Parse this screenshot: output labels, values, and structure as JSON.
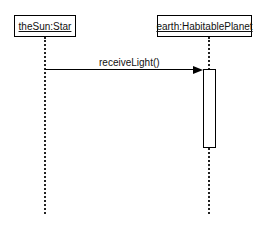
{
  "diagram": {
    "type": "sequence",
    "objects": [
      {
        "label": "theSun:Star"
      },
      {
        "label": "earth:HabitablePlanet"
      }
    ],
    "messages": [
      {
        "label": "receiveLight()",
        "from": "theSun:Star",
        "to": "earth:HabitablePlanet"
      }
    ]
  }
}
